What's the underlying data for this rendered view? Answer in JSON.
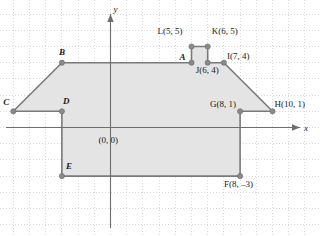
{
  "figure": {
    "background_color": "#ffffff",
    "grid": {
      "visible": true,
      "style": "dotted",
      "color": "#c9c9c9",
      "spacing_units": 1,
      "spacing_px": 16.2,
      "x_range": [
        -7,
        13
      ],
      "y_range": [
        -7,
        7
      ]
    },
    "axes": {
      "x_label": "x",
      "y_label": "y",
      "color": "#6e6e6e",
      "arrowheads": true
    },
    "origin_label": "(0, 0)"
  },
  "chart_data": {
    "type": "scatter",
    "xlabel": "x",
    "ylabel": "y",
    "xlim": [
      -7,
      13
    ],
    "ylim": [
      -7,
      7
    ],
    "grid": true,
    "legend": "none",
    "shape": {
      "name": "shaded-polygon",
      "fill_color": "#e4e4e4",
      "stroke_color": "#7a7a7a",
      "vertex_marker_color": "#8a8a8a",
      "vertex_order": [
        "A",
        "L",
        "K",
        "J",
        "I",
        "H",
        "G",
        "F",
        "E",
        "D",
        "C",
        "B"
      ],
      "closed": true
    },
    "points": [
      {
        "id": "A",
        "label": "A",
        "x": 5,
        "y": 4,
        "label_dx": -12,
        "label_dy": -4,
        "style": "italic-bold",
        "has_marker": true
      },
      {
        "id": "L",
        "label": "L(5, 5)",
        "x": 5,
        "y": 5,
        "label_dx": -34,
        "label_dy": -14,
        "style": "plain",
        "has_marker": true
      },
      {
        "id": "K",
        "label": "K(6, 5)",
        "x": 6,
        "y": 5,
        "label_dx": 4,
        "label_dy": -14,
        "style": "plain",
        "has_marker": true
      },
      {
        "id": "J",
        "label": "J(6, 4)",
        "x": 6,
        "y": 4,
        "label_dx": -12,
        "label_dy": 9,
        "style": "plain",
        "has_marker": true
      },
      {
        "id": "I",
        "label": "I(7, 4)",
        "x": 7,
        "y": 4,
        "label_dx": 3,
        "label_dy": -5,
        "style": "plain",
        "has_marker": true
      },
      {
        "id": "H",
        "label": "H(10, 1)",
        "x": 10,
        "y": 1,
        "label_dx": 2,
        "label_dy": -5,
        "style": "plain",
        "has_marker": true
      },
      {
        "id": "G",
        "label": "G(8, 1)",
        "x": 8,
        "y": 1,
        "label_dx": -30,
        "label_dy": -5,
        "style": "plain",
        "has_marker": true
      },
      {
        "id": "F",
        "label": "F(8, –3)",
        "x": 8,
        "y": -3,
        "label_dx": -16,
        "label_dy": 10,
        "style": "plain",
        "has_marker": true
      },
      {
        "id": "E",
        "label": "E",
        "x": -3,
        "y": -3,
        "label_dx": 4,
        "label_dy": -8,
        "style": "italic-bold",
        "has_marker": true
      },
      {
        "id": "D",
        "label": "D",
        "x": -3,
        "y": 1,
        "label_dx": 1,
        "label_dy": -8,
        "style": "italic-bold",
        "has_marker": true
      },
      {
        "id": "C",
        "label": "C",
        "x": -6,
        "y": 1,
        "label_dx": -10,
        "label_dy": -7,
        "style": "italic-bold",
        "has_marker": true
      },
      {
        "id": "B",
        "label": "B",
        "x": -3,
        "y": 4,
        "label_dx": -3,
        "label_dy": -9,
        "style": "italic-bold",
        "has_marker": true
      }
    ],
    "edges": [
      {
        "from": "A",
        "to": "L"
      },
      {
        "from": "L",
        "to": "K"
      },
      {
        "from": "K",
        "to": "J"
      },
      {
        "from": "J",
        "to": "I"
      },
      {
        "from": "I",
        "to": "H"
      },
      {
        "from": "H",
        "to": "G"
      },
      {
        "from": "G",
        "to": "F"
      },
      {
        "from": "F",
        "to": "E"
      },
      {
        "from": "E",
        "to": "D"
      },
      {
        "from": "D",
        "to": "C"
      },
      {
        "from": "C",
        "to": "B"
      },
      {
        "from": "B",
        "to": "A"
      }
    ]
  }
}
